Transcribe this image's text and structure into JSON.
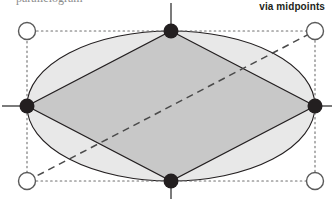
{
  "figure": {
    "caption": "via midpoints",
    "clipped_top_text": "parallelogram",
    "width": 333,
    "height": 200,
    "colors": {
      "background": "#ffffff",
      "ellipse_fill": "#e8e8e8",
      "rhombus_fill": "#c8c8c8",
      "stroke": "#231f20",
      "dotted_stroke": "#6e6e6e",
      "dashed_stroke": "#4a4a4a",
      "vertex_fill": "#231f20",
      "corner_fill": "#ffffff"
    }
  },
  "geometry": {
    "rectangle": {
      "name": "bounding-rectangle",
      "style": "dotted",
      "left": 27,
      "top": 31,
      "right": 315,
      "bottom": 181
    },
    "ellipse": {
      "name": "inscribed-ellipse",
      "cx": 171,
      "cy": 106,
      "rx": 144,
      "ry": 75
    },
    "rhombus": {
      "name": "midpoint-rhombus",
      "points": "171,31 315,106 171,181 27,106"
    },
    "diagonal": {
      "name": "rectangle-diagonal",
      "style": "dashed",
      "x1": 27,
      "y1": 181,
      "x2": 315,
      "y2": 31
    },
    "corner_points": [
      {
        "label": "top-left-corner",
        "cx": 27,
        "cy": 31,
        "r": 8.5
      },
      {
        "label": "top-right-corner",
        "cx": 315,
        "cy": 31,
        "r": 8.5
      },
      {
        "label": "bottom-left-corner",
        "cx": 27,
        "cy": 181,
        "r": 8.5
      },
      {
        "label": "bottom-right-corner",
        "cx": 315,
        "cy": 181,
        "r": 8.5
      }
    ],
    "midpoints": [
      {
        "label": "top-midpoint",
        "cx": 171,
        "cy": 31,
        "r": 7.5,
        "tick": "up"
      },
      {
        "label": "right-midpoint",
        "cx": 315,
        "cy": 106,
        "r": 7.5,
        "tick": "right"
      },
      {
        "label": "bottom-midpoint",
        "cx": 171,
        "cy": 181,
        "r": 7.5,
        "tick": "down"
      },
      {
        "label": "left-midpoint",
        "cx": 27,
        "cy": 106,
        "r": 7.5,
        "tick": "left"
      }
    ]
  }
}
